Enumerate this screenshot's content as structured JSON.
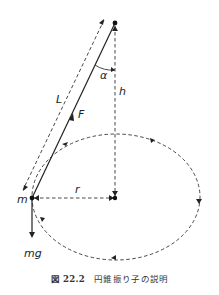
{
  "diagram": {
    "labels": {
      "alpha": "α",
      "h": "h",
      "L": "L",
      "F": "F",
      "r": "r",
      "m": "m",
      "mg": "mg"
    },
    "colors": {
      "stroke": "#222222",
      "background": "#ffffff"
    }
  },
  "caption": {
    "number": "図 22.2",
    "text": "円錐振り子の説明"
  }
}
